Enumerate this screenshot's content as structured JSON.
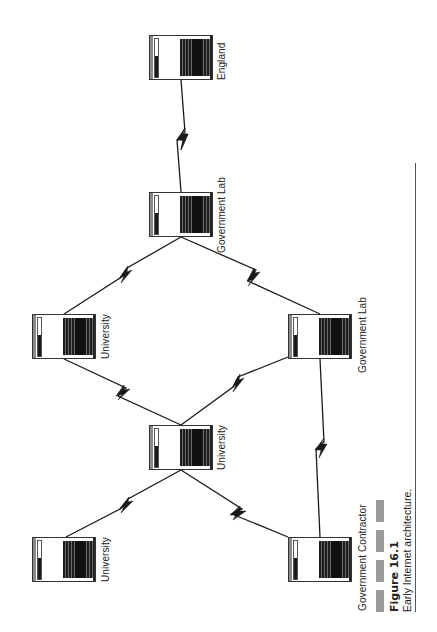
{
  "figure": {
    "number_label": "Figure 16.1",
    "caption": "Early Internet architecture.",
    "decor_squares": 4
  },
  "nodes": [
    {
      "id": "england",
      "label": "England",
      "x": 149,
      "y": 35
    },
    {
      "id": "gov-lab-top",
      "label": "Government Lab",
      "x": 149,
      "y": 192
    },
    {
      "id": "university-left",
      "label": "University",
      "x": 32,
      "y": 314
    },
    {
      "id": "gov-lab-right",
      "label": "Government Lab",
      "x": 288,
      "y": 314
    },
    {
      "id": "university-center",
      "label": "University",
      "x": 149,
      "y": 425
    },
    {
      "id": "university-bottom",
      "label": "University",
      "x": 32,
      "y": 537
    },
    {
      "id": "gov-contractor",
      "label": "Government Contractor",
      "x": 288,
      "y": 537
    }
  ],
  "links": [
    {
      "from": "england",
      "to": "gov-lab-top",
      "type": "zigzag"
    },
    {
      "from": "gov-lab-top",
      "to": "university-left",
      "type": "zigzag"
    },
    {
      "from": "gov-lab-top",
      "to": "gov-lab-right",
      "type": "zigzag"
    },
    {
      "from": "university-left",
      "to": "university-center",
      "type": "zigzag"
    },
    {
      "from": "gov-lab-right",
      "to": "university-center",
      "type": "zigzag"
    },
    {
      "from": "university-center",
      "to": "university-bottom",
      "type": "zigzag"
    },
    {
      "from": "university-center",
      "to": "gov-contractor",
      "type": "zigzag"
    },
    {
      "from": "gov-lab-right",
      "to": "gov-contractor",
      "type": "zigzag"
    }
  ],
  "colors": {
    "line": "#1a1a1a",
    "decor_gray": "#9a9a9a",
    "rule": "#555555"
  }
}
